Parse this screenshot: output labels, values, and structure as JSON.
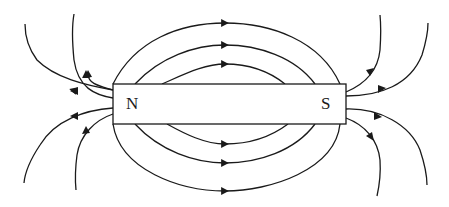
{
  "diagram": {
    "magnet": {
      "north_label": "N",
      "south_label": "S",
      "color": "#ffffff",
      "stroke": "#1a1a1a"
    },
    "field_lines": {
      "direction": "from N to S outside the magnet",
      "top_arcs": 3,
      "bottom_arcs": 3,
      "left_fan_lines": 4,
      "right_fan_lines": 4
    }
  }
}
